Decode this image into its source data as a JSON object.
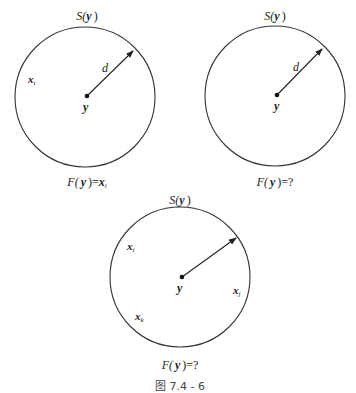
{
  "figure": {
    "caption": "图 7.4 - 6",
    "colors": {
      "stroke": "#333333",
      "text": "#222222",
      "background": "#ffffff"
    }
  },
  "panels": [
    {
      "id": "panel-1",
      "circle": {
        "cx": 85,
        "cy": 97,
        "r": 70
      },
      "center_dot": {
        "x": 87,
        "y": 96
      },
      "arrow": {
        "x1": 87,
        "y1": 96,
        "x2": 133,
        "y2": 51,
        "label": "d",
        "label_x": 102,
        "label_y": 72
      },
      "top_label": {
        "S": "S(",
        "var": "y",
        "close": ")",
        "x": 87,
        "y": 20
      },
      "center_label": {
        "text": "y",
        "x": 83,
        "y": 111
      },
      "points": [
        {
          "base": "x",
          "sub": "i",
          "x": 30,
          "y": 83
        }
      ],
      "bottom_label": {
        "F": "F(",
        "var": "y",
        "close": ")=",
        "rhs_base": "x",
        "rhs_sub": "i",
        "rhs_q": "",
        "x": 87,
        "y": 185
      }
    },
    {
      "id": "panel-2",
      "circle": {
        "cx": 275,
        "cy": 96,
        "r": 70
      },
      "center_dot": {
        "x": 277,
        "y": 95
      },
      "arrow": {
        "x1": 277,
        "y1": 95,
        "x2": 322,
        "y2": 49,
        "label": "d",
        "label_x": 293,
        "label_y": 71
      },
      "top_label": {
        "S": "S(",
        "var": "y",
        "close": ")",
        "x": 275,
        "y": 20
      },
      "center_label": {
        "text": "y",
        "x": 275,
        "y": 110
      },
      "points": [],
      "bottom_label": {
        "F": "F(",
        "var": "y",
        "close": ")=",
        "rhs_base": "",
        "rhs_sub": "",
        "rhs_q": "?",
        "x": 275,
        "y": 185
      }
    },
    {
      "id": "panel-3",
      "circle": {
        "cx": 180,
        "cy": 277,
        "r": 70
      },
      "center_dot": {
        "x": 182,
        "y": 277
      },
      "arrow": {
        "x1": 182,
        "y1": 277,
        "x2": 236,
        "y2": 238,
        "label": "",
        "label_x": 0,
        "label_y": 0
      },
      "top_label": {
        "S": "S(",
        "var": "y",
        "close": ")",
        "x": 180,
        "y": 204
      },
      "center_label": {
        "text": "y",
        "x": 180,
        "y": 292
      },
      "points": [
        {
          "base": "x",
          "sub": "i",
          "x": 129,
          "y": 250
        },
        {
          "base": "x",
          "sub": "j",
          "x": 234,
          "y": 294
        },
        {
          "base": "x",
          "sub": "k",
          "x": 136,
          "y": 320
        }
      ],
      "bottom_label": {
        "F": "F(",
        "var": "y",
        "close": ")=",
        "rhs_base": "",
        "rhs_sub": "",
        "rhs_q": "?",
        "x": 180,
        "y": 368
      }
    }
  ]
}
